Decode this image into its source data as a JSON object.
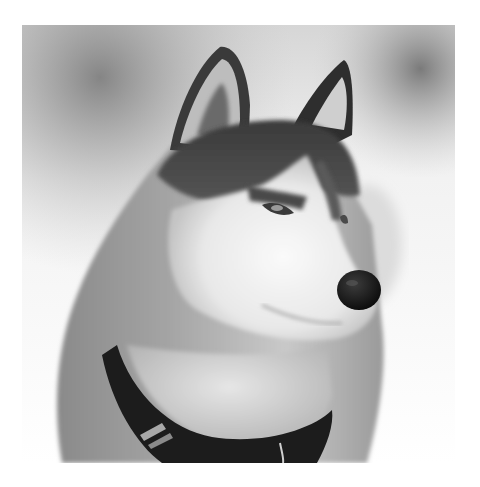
{
  "image": {
    "subject": "Siberian Husky head-and-shoulders portrait, looking right",
    "style": "grayscale photograph",
    "colors": {
      "page_background": "#ffffff",
      "backdrop_dark": "#8a8a8a",
      "backdrop_light": "#f4f4f4",
      "fur_dark": "#2a2a2a",
      "fur_mid": "#8f8f8f",
      "fur_light": "#f2f2f2",
      "nose": "#111111",
      "collar": "#1a1a1a"
    }
  }
}
